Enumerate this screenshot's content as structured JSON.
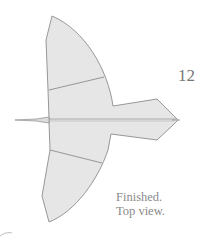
{
  "step_number": "12",
  "caption": {
    "line1": "Finished.",
    "line2": "Top view."
  },
  "colors": {
    "fill": "#e6e6e6",
    "stroke": "#8c8c8c",
    "text": "#8a8a8a"
  }
}
